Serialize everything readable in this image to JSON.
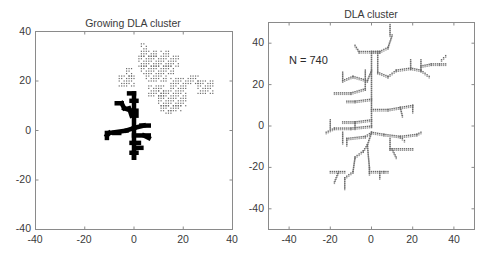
{
  "chart_data": [
    {
      "type": "scatter",
      "title": "Growing DLA cluster",
      "xlabel": "",
      "ylabel": "",
      "xlim": [
        -40,
        40
      ],
      "ylim": [
        -40,
        40
      ],
      "xticks": [
        -40,
        -20,
        0,
        20,
        40
      ],
      "yticks": [
        -40,
        -20,
        0,
        20,
        40
      ],
      "grid": false,
      "series": [
        {
          "name": "cluster (bold)",
          "style": "bold black squares",
          "color": "#000000",
          "segments": [
            [
              [
                0,
                -11
              ],
              [
                0,
                15
              ]
            ],
            [
              [
                -2,
                15
              ],
              [
                0,
                15
              ]
            ],
            [
              [
                -1,
                12
              ],
              [
                1,
                12
              ]
            ],
            [
              [
                -7,
                11
              ],
              [
                -5,
                11
              ]
            ],
            [
              [
                -5,
                11
              ],
              [
                -4,
                9
              ]
            ],
            [
              [
                -4,
                9
              ],
              [
                -1,
                8
              ]
            ],
            [
              [
                -2,
                9
              ],
              [
                -1,
                6
              ]
            ],
            [
              [
                1,
                8
              ],
              [
                1,
                6
              ]
            ],
            [
              [
                -11,
                -2
              ],
              [
                -10,
                -1
              ]
            ],
            [
              [
                -10,
                -1
              ],
              [
                -3,
                0
              ]
            ],
            [
              [
                -8,
                -1
              ],
              [
                -6,
                -1
              ]
            ],
            [
              [
                -3,
                0
              ],
              [
                0,
                1
              ]
            ],
            [
              [
                0,
                1
              ],
              [
                4,
                2
              ]
            ],
            [
              [
                3,
                2
              ],
              [
                6,
                2
              ]
            ],
            [
              [
                -11,
                -3
              ],
              [
                -11,
                -1
              ]
            ],
            [
              [
                0,
                -2
              ],
              [
                6,
                -2
              ]
            ],
            [
              [
                4,
                -2
              ],
              [
                6,
                -3
              ]
            ],
            [
              [
                -1,
                -5
              ],
              [
                2,
                -5
              ]
            ],
            [
              [
                1,
                -7
              ],
              [
                3,
                -7
              ]
            ],
            [
              [
                0,
                -9
              ],
              [
                0,
                -11
              ]
            ],
            [
              [
                -1,
                -9
              ],
              [
                1,
                -9
              ]
            ]
          ]
        },
        {
          "name": "walkers (gray dots)",
          "style": "small gray dots",
          "color": "#6a6a6a",
          "regions": [
            {
              "x": [
                3,
                5
              ],
              "y": [
                33,
                35
              ]
            },
            {
              "x": [
                3,
                9
              ],
              "y": [
                30,
                32
              ]
            },
            {
              "x": [
                11,
                14
              ],
              "y": [
                31,
                32
              ]
            },
            {
              "x": [
                2,
                18
              ],
              "y": [
                26,
                30
              ]
            },
            {
              "x": [
                3,
                16
              ],
              "y": [
                23,
                26
              ]
            },
            {
              "x": [
                -3,
                -1
              ],
              "y": [
                22,
                25
              ]
            },
            {
              "x": [
                -6,
                0
              ],
              "y": [
                18,
                22
              ]
            },
            {
              "x": [
                5,
                13
              ],
              "y": [
                20,
                22
              ]
            },
            {
              "x": [
                6,
                12
              ],
              "y": [
                14,
                18
              ]
            },
            {
              "x": [
                15,
                21
              ],
              "y": [
                17,
                21
              ]
            },
            {
              "x": [
                22,
                26
              ],
              "y": [
                19,
                22
              ]
            },
            {
              "x": [
                26,
                32
              ],
              "y": [
                15,
                20
              ]
            },
            {
              "x": [
                10,
                21
              ],
              "y": [
                10,
                16
              ]
            },
            {
              "x": [
                11,
                19
              ],
              "y": [
                8,
                10
              ]
            },
            {
              "x": [
                13,
                15
              ],
              "y": [
                7,
                8
              ]
            }
          ]
        }
      ],
      "annotations": []
    },
    {
      "type": "scatter",
      "title": "DLA cluster",
      "xlabel": "",
      "ylabel": "",
      "xlim": [
        -50,
        50
      ],
      "ylim": [
        -50,
        50
      ],
      "xticks": [
        -40,
        -20,
        0,
        20,
        40
      ],
      "yticks": [
        -40,
        -20,
        0,
        20,
        40
      ],
      "grid": false,
      "series": [
        {
          "name": "cluster",
          "style": "small gray dots",
          "color": "#6a6a6a",
          "n_particles": 740,
          "branches": [
            [
              [
                0,
                0
              ],
              [
                0,
                36
              ]
            ],
            [
              [
                0,
                36
              ],
              [
                4,
                36
              ]
            ],
            [
              [
                4,
                36
              ],
              [
                8,
                38
              ]
            ],
            [
              [
                8,
                38
              ],
              [
                10,
                44
              ]
            ],
            [
              [
                9,
                44
              ],
              [
                9,
                49
              ]
            ],
            [
              [
                4,
                36
              ],
              [
                -6,
                36
              ]
            ],
            [
              [
                -6,
                36
              ],
              [
                -8,
                39
              ]
            ],
            [
              [
                3,
                36
              ],
              [
                3,
                26
              ]
            ],
            [
              [
                3,
                26
              ],
              [
                8,
                24
              ]
            ],
            [
              [
                8,
                24
              ],
              [
                12,
                27
              ]
            ],
            [
              [
                12,
                27
              ],
              [
                19,
                28
              ]
            ],
            [
              [
                19,
                28
              ],
              [
                24,
                27
              ]
            ],
            [
              [
                24,
                27
              ],
              [
                24,
                32
              ]
            ],
            [
              [
                24,
                27
              ],
              [
                28,
                24
              ]
            ],
            [
              [
                24,
                29
              ],
              [
                29,
                30
              ]
            ],
            [
              [
                29,
                30
              ],
              [
                33,
                30
              ]
            ],
            [
              [
                33,
                30
              ],
              [
                36,
                30
              ]
            ],
            [
              [
                34,
                32
              ],
              [
                36,
                34
              ]
            ],
            [
              [
                19,
                28
              ],
              [
                19,
                32
              ]
            ],
            [
              [
                0,
                27
              ],
              [
                -2,
                22
              ]
            ],
            [
              [
                -3,
                27
              ],
              [
                -3,
                18
              ]
            ],
            [
              [
                -2,
                22
              ],
              [
                -9,
                24
              ]
            ],
            [
              [
                -9,
                24
              ],
              [
                -14,
                22
              ]
            ],
            [
              [
                -14,
                22
              ],
              [
                -14,
                26
              ]
            ],
            [
              [
                -3,
                18
              ],
              [
                -10,
                16
              ]
            ],
            [
              [
                -10,
                16
              ],
              [
                -18,
                16
              ]
            ],
            [
              [
                0,
                13
              ],
              [
                -8,
                12
              ]
            ],
            [
              [
                -8,
                12
              ],
              [
                -12,
                12
              ]
            ],
            [
              [
                0,
                8
              ],
              [
                8,
                8
              ]
            ],
            [
              [
                8,
                8
              ],
              [
                14,
                9
              ]
            ],
            [
              [
                14,
                9
              ],
              [
                20,
                10
              ]
            ],
            [
              [
                20,
                10
              ],
              [
                20,
                7
              ]
            ],
            [
              [
                14,
                9
              ],
              [
                15,
                5
              ]
            ],
            [
              [
                0,
                3
              ],
              [
                -8,
                2
              ]
            ],
            [
              [
                -8,
                2
              ],
              [
                -14,
                2
              ]
            ],
            [
              [
                -8,
                2
              ],
              [
                -8,
                -1
              ]
            ],
            [
              [
                0,
                0
              ],
              [
                -10,
                -1
              ]
            ],
            [
              [
                -10,
                -1
              ],
              [
                -18,
                -1
              ]
            ],
            [
              [
                -18,
                -1
              ],
              [
                -22,
                -3
              ]
            ],
            [
              [
                -20,
                3
              ],
              [
                -20,
                -1
              ]
            ],
            [
              [
                -14,
                -3
              ],
              [
                -14,
                -8
              ]
            ],
            [
              [
                0,
                -3
              ],
              [
                -3,
                -5
              ]
            ],
            [
              [
                -3,
                -5
              ],
              [
                -12,
                -6
              ]
            ],
            [
              [
                -12,
                -6
              ],
              [
                -12,
                -9
              ]
            ],
            [
              [
                0,
                -3
              ],
              [
                6,
                -4
              ]
            ],
            [
              [
                6,
                -4
              ],
              [
                14,
                -5
              ]
            ],
            [
              [
                14,
                -5
              ],
              [
                22,
                -4
              ]
            ],
            [
              [
                22,
                -4
              ],
              [
                24,
                -3
              ]
            ],
            [
              [
                14,
                -5
              ],
              [
                16,
                -7
              ]
            ],
            [
              [
                9,
                -6
              ],
              [
                9,
                -11
              ]
            ],
            [
              [
                9,
                -11
              ],
              [
                20,
                -11
              ]
            ],
            [
              [
                10,
                -11
              ],
              [
                12,
                -15
              ]
            ],
            [
              [
                0,
                -3
              ],
              [
                -2,
                -9
              ]
            ],
            [
              [
                -2,
                -9
              ],
              [
                -4,
                -12
              ]
            ],
            [
              [
                -4,
                -12
              ],
              [
                -8,
                -15
              ]
            ],
            [
              [
                -8,
                -15
              ],
              [
                -9,
                -22
              ]
            ],
            [
              [
                -9,
                -22
              ],
              [
                -13,
                -25
              ]
            ],
            [
              [
                -13,
                -25
              ],
              [
                -13,
                -30
              ]
            ],
            [
              [
                -13,
                -22
              ],
              [
                -20,
                -22
              ]
            ],
            [
              [
                -16,
                -22
              ],
              [
                -18,
                -27
              ]
            ],
            [
              [
                -2,
                -9
              ],
              [
                -1,
                -20
              ]
            ],
            [
              [
                -1,
                -20
              ],
              [
                -1,
                -23
              ]
            ],
            [
              [
                -1,
                -22
              ],
              [
                6,
                -22
              ]
            ],
            [
              [
                4,
                -22
              ],
              [
                4,
                -25
              ]
            ],
            [
              [
                6,
                -22
              ],
              [
                8,
                -22
              ]
            ]
          ]
        }
      ],
      "annotations": [
        {
          "text": "N = 740",
          "x": -40,
          "y": 31
        }
      ]
    }
  ],
  "plots": [
    {
      "title": "Growing DLA cluster",
      "xtick_labels": [
        "-40",
        "-20",
        "0",
        "20",
        "40"
      ],
      "ytick_labels": [
        "-40",
        "-20",
        "0",
        "20",
        "40"
      ]
    },
    {
      "title": "DLA cluster",
      "annotation": "N = 740",
      "xtick_labels": [
        "-40",
        "-20",
        "0",
        "20",
        "40"
      ],
      "ytick_labels": [
        "-40",
        "-20",
        "0",
        "20",
        "40"
      ]
    }
  ]
}
